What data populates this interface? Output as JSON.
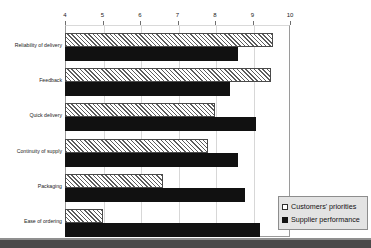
{
  "chart_data": {
    "type": "bar",
    "orientation": "horizontal",
    "title": "",
    "subtitle": "",
    "xlabel": "",
    "ylabel": "",
    "xlim": [
      4,
      10
    ],
    "xticks": [
      "4",
      "5",
      "6",
      "7",
      "8",
      "9",
      "10"
    ],
    "grid": true,
    "legend_position": "bottom-right",
    "categories": [
      "Reliability of delivery",
      "Feedback",
      "Quick delivery",
      "Continuity of supply",
      "Packaging",
      "Ease of ordering"
    ],
    "series": [
      {
        "name": "Customers' priorities",
        "style": "hatched",
        "color": "#e9e9e9",
        "values": [
          9.55,
          9.5,
          8.0,
          7.8,
          6.6,
          5.0
        ]
      },
      {
        "name": "Supplier performance",
        "style": "solid",
        "color": "#111111",
        "values": [
          8.6,
          8.4,
          9.1,
          8.6,
          8.8,
          9.2
        ]
      }
    ]
  },
  "legend": {
    "items": [
      {
        "label": "Customers' priorities",
        "icon": "hatched-square-icon"
      },
      {
        "label": "Supplier performance",
        "icon": "filled-square-icon"
      }
    ]
  }
}
